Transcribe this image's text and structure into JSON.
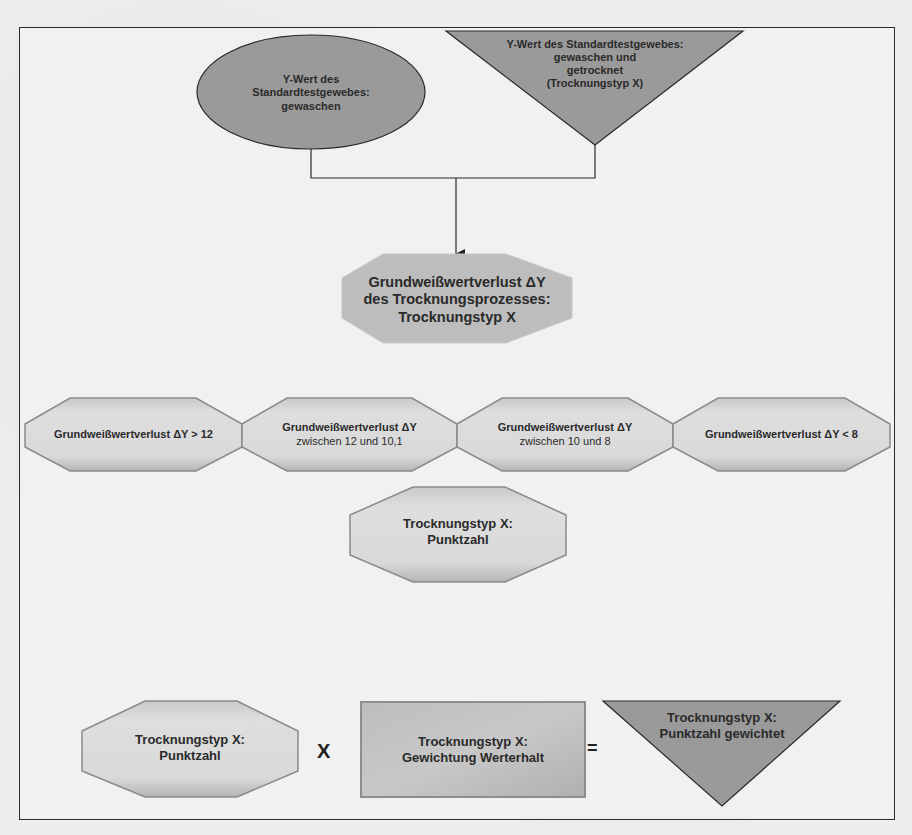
{
  "diagram": {
    "type": "flowchart",
    "colors": {
      "dark_shape_fill": "#9a9a9a",
      "light_shape_fill": "#d6d6d6",
      "outline": "#2a2a2a",
      "background": "#f0f0f0"
    },
    "inputs": {
      "washed": {
        "shape": "ellipse",
        "label": "Y-Wert des\nStandardtestgewebes:\ngewaschen"
      },
      "washed_dried": {
        "shape": "inverted-triangle",
        "label": "Y-Wert des Standardtestgewebes:\ngewaschen und\ngetrocknet\n(Trocknungstyp X)"
      }
    },
    "loss": {
      "shape": "octagon",
      "label_line1": "Grundweißwertverlust ΔY",
      "label_line2": "des Trocknungsprozesses:",
      "label_line3": "Trocknungstyp X"
    },
    "categories": [
      {
        "line1": "Grundweißwertverlust ΔY > 12",
        "line2": ""
      },
      {
        "line1": "Grundweißwertverlust ΔY",
        "line2": "zwischen 12 und 10,1"
      },
      {
        "line1": "Grundweißwertverlust ΔY",
        "line2": "zwischen 10 und 8"
      },
      {
        "line1": "Grundweißwertverlust ΔY < 8",
        "line2": ""
      }
    ],
    "score": {
      "shape": "octagon",
      "label": "Trocknungstyp X:\nPunktzahl"
    },
    "formula": {
      "operand1": "Trocknungstyp X:\nPunktzahl",
      "operator1": "X",
      "operand2": "Trocknungstyp X:\nGewichtung Werterhalt",
      "operator2": "=",
      "result": "Trocknungstyp X:\nPunktzahl gewichtet"
    }
  }
}
